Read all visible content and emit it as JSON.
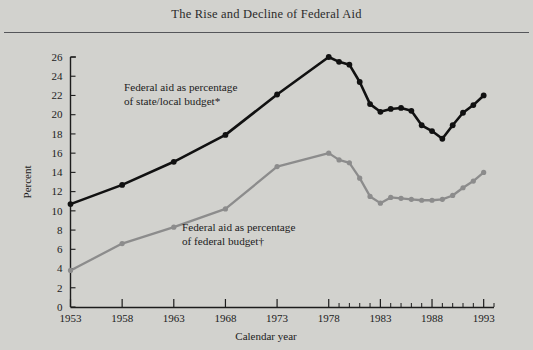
{
  "figure": {
    "title": "The Rise and Decline of Federal Aid",
    "background_color": "#d2d2ce",
    "rule_color": "#55565a"
  },
  "chart_data": {
    "type": "line",
    "title": "The Rise and Decline of Federal Aid",
    "xlabel": "Calendar year",
    "ylabel": "Percent",
    "xlim": [
      1953,
      1994
    ],
    "ylim": [
      0,
      26
    ],
    "grid": false,
    "legend_position": "inline-annotation",
    "y_ticks": [
      0,
      2,
      4,
      6,
      8,
      10,
      12,
      14,
      16,
      18,
      20,
      22,
      24,
      26
    ],
    "x_ticks_major": [
      1953,
      1958,
      1963,
      1968,
      1973,
      1978,
      1983,
      1988,
      1993
    ],
    "x_ticks_minor": [
      1979,
      1980,
      1981,
      1982,
      1984,
      1985,
      1986,
      1987,
      1989,
      1990,
      1991,
      1992,
      1994
    ],
    "series": [
      {
        "name": "Federal aid as percentage of state/local budget*",
        "color": "#111111",
        "x": [
          1953,
          1958,
          1963,
          1968,
          1973,
          1978,
          1979,
          1980,
          1981,
          1982,
          1983,
          1984,
          1985,
          1986,
          1987,
          1988,
          1989,
          1990,
          1991,
          1992,
          1993
        ],
        "values": [
          10.7,
          12.7,
          15.1,
          17.9,
          22.1,
          26.0,
          25.5,
          25.2,
          23.4,
          21.1,
          20.3,
          20.6,
          20.7,
          20.4,
          18.9,
          18.3,
          17.5,
          18.9,
          20.2,
          21.0,
          22.0
        ]
      },
      {
        "name": "Federal aid as percentage of federal budget†",
        "color": "#8c8c8c",
        "x": [
          1953,
          1958,
          1963,
          1968,
          1973,
          1978,
          1979,
          1980,
          1981,
          1982,
          1983,
          1984,
          1985,
          1986,
          1987,
          1988,
          1989,
          1990,
          1991,
          1992,
          1993
        ],
        "values": [
          3.8,
          6.6,
          8.3,
          10.2,
          14.6,
          16.0,
          15.3,
          15.0,
          13.4,
          11.5,
          10.8,
          11.4,
          11.3,
          11.2,
          11.1,
          11.1,
          11.2,
          11.6,
          12.4,
          13.1,
          14.0
        ]
      }
    ],
    "annotations": [
      {
        "id": "note-state-local",
        "line1": "Federal aid as percentage",
        "line2": "of state/local budget*"
      },
      {
        "id": "note-federal",
        "line1": "Federal aid as percentage",
        "line2": "of federal budget†"
      }
    ]
  }
}
